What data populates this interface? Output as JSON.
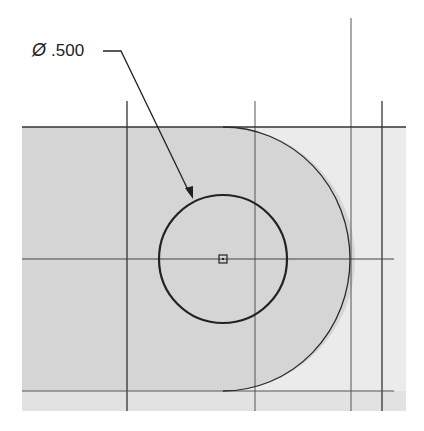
{
  "drawing": {
    "dimension": {
      "symbol": "Ø",
      "value": ".500"
    },
    "colors": {
      "background": "#ffffff",
      "part_fill": "#d5d5d5",
      "outside_fill": "#ebebeb",
      "line": "#2a2a2a",
      "construction_line": "#4a4a4a"
    },
    "geometry": {
      "center": [
        223,
        259
      ],
      "hole_radius": 64,
      "outer_arc_radius": 127
    }
  }
}
